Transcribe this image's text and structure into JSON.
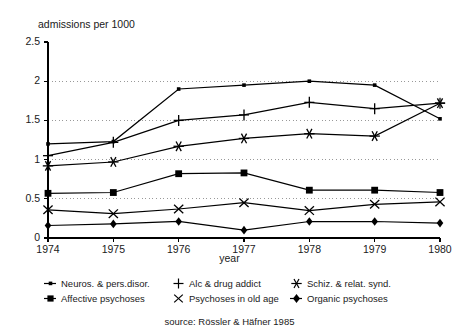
{
  "chart_data": {
    "type": "line",
    "title": "",
    "ylabel": "admissions per 1000",
    "xlabel": "year",
    "categories": [
      "1974",
      "1975",
      "1976",
      "1977",
      "1978",
      "1979",
      "1980"
    ],
    "x": [
      1974,
      1975,
      1976,
      1977,
      1978,
      1979,
      1980
    ],
    "ylim": [
      0,
      2.5
    ],
    "yticks": [
      "0",
      "0.5",
      "1",
      "1.5",
      "2",
      "2.5"
    ],
    "ytick_values": [
      0,
      0.5,
      1,
      1.5,
      2,
      2.5
    ],
    "grid": "horizontal-dotted",
    "legend_position": "below-axis",
    "series": [
      {
        "name": "Neuros. & pers.disor.",
        "marker": "small-dot",
        "values": [
          1.2,
          1.23,
          1.9,
          1.95,
          2.0,
          1.95,
          1.52
        ]
      },
      {
        "name": "Alc & drug addict",
        "marker": "plus",
        "values": [
          1.05,
          1.22,
          1.5,
          1.57,
          1.73,
          1.65,
          1.72
        ]
      },
      {
        "name": "Schiz. & relat. synd.",
        "marker": "asterisk",
        "values": [
          0.92,
          0.97,
          1.17,
          1.27,
          1.33,
          1.3,
          1.72
        ]
      },
      {
        "name": "Affective psychoses",
        "marker": "filled-square",
        "values": [
          0.57,
          0.58,
          0.82,
          0.83,
          0.61,
          0.61,
          0.58
        ]
      },
      {
        "name": "Psychoses in old age",
        "marker": "x-cross",
        "values": [
          0.36,
          0.31,
          0.37,
          0.45,
          0.35,
          0.43,
          0.46
        ]
      },
      {
        "name": "Organic psychoses",
        "marker": "filled-diamond",
        "values": [
          0.16,
          0.18,
          0.21,
          0.1,
          0.21,
          0.21,
          0.19
        ]
      }
    ],
    "source_note": "source: Rössler & Häfner 1985"
  },
  "legend": {
    "row1": [
      {
        "label": "Neuros. & pers.disor.",
        "marker": "small-dot"
      },
      {
        "label": "Alc & drug addict",
        "marker": "plus"
      },
      {
        "label": "Schiz. & relat. synd.",
        "marker": "asterisk"
      }
    ],
    "row2": [
      {
        "label": "Affective psychoses",
        "marker": "filled-square"
      },
      {
        "label": "Psychoses in old age",
        "marker": "x-cross"
      },
      {
        "label": "Organic psychoses",
        "marker": "filled-diamond"
      }
    ]
  },
  "colors": {
    "line": "#000000",
    "grid": "#999999",
    "axis": "#000000",
    "background": "#ffffff",
    "text": "#1a1a1a"
  }
}
